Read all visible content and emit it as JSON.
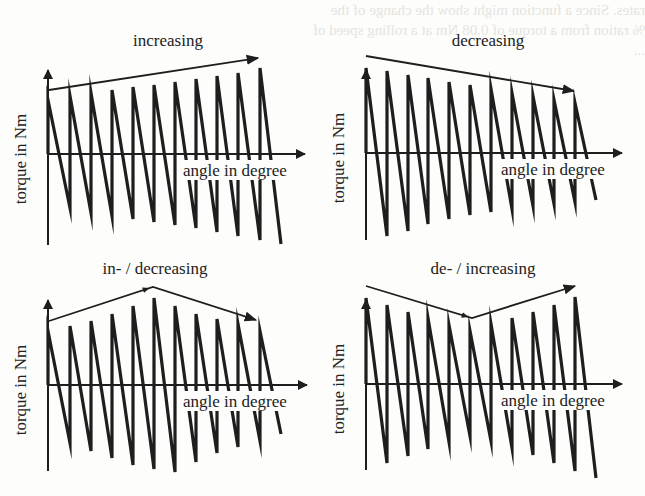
{
  "figure": {
    "colors": {
      "ink": "#1e1e1e",
      "background": "#fdfdfb",
      "bleed_through": "#e4e4e0"
    }
  },
  "chart_data": [
    {
      "id": "increasing",
      "type": "line",
      "title": "increasing",
      "xlabel": "angle in degree",
      "ylabel": "torque in Nm",
      "description": "sawtooth torque curve with amplitude increasing over angle",
      "origin": [
        48,
        154
      ],
      "y_axis": {
        "top": 68,
        "bottom": 245
      },
      "x_axis": {
        "end": 305
      },
      "peaks_x": [
        48,
        70,
        91,
        112,
        133,
        154,
        175,
        196,
        217,
        238,
        260
      ],
      "peaks_y": [
        100,
        96,
        93,
        90,
        87,
        85,
        82,
        79,
        76,
        73,
        68
      ],
      "troughs_x": [
        70,
        91,
        112,
        133,
        154,
        175,
        196,
        217,
        238,
        260,
        281
      ],
      "troughs_y": [
        208,
        213,
        216,
        219,
        222,
        225,
        228,
        232,
        236,
        240,
        244
      ],
      "trend": {
        "points": [
          [
            49,
            90
          ],
          [
            258,
            58
          ]
        ],
        "title_pos": [
          168,
          46
        ]
      }
    },
    {
      "id": "decreasing",
      "type": "line",
      "title": "decreasing",
      "xlabel": "angle in degree",
      "ylabel": "torque in Nm",
      "description": "sawtooth torque curve with amplitude decreasing over angle",
      "origin": [
        366,
        153
      ],
      "y_axis": {
        "top": 68,
        "bottom": 240
      },
      "x_axis": {
        "end": 622
      },
      "peaks_x": [
        366,
        387,
        408,
        428,
        449,
        470,
        491,
        512,
        533,
        554,
        575
      ],
      "peaks_y": [
        68,
        71,
        75,
        78,
        82,
        85,
        89,
        93,
        96,
        100,
        103
      ],
      "troughs_x": [
        387,
        408,
        428,
        449,
        470,
        491,
        512,
        533,
        554,
        575,
        596
      ],
      "troughs_y": [
        236,
        231,
        224,
        219,
        215,
        212,
        209,
        206,
        204,
        202,
        200
      ],
      "trend": {
        "points": [
          [
            366,
            56
          ],
          [
            574,
            91
          ]
        ],
        "title_pos": [
          488,
          46
        ]
      }
    },
    {
      "id": "in-decreasing",
      "type": "line",
      "title": "in- / decreasing",
      "xlabel": "angle in degree",
      "ylabel": "torque in Nm",
      "description": "sawtooth torque curve with amplitude first increasing then decreasing",
      "origin": [
        48,
        385
      ],
      "y_axis": {
        "top": 298,
        "bottom": 471
      },
      "x_axis": {
        "end": 307
      },
      "peaks_x": [
        48,
        70,
        91,
        112,
        133,
        154,
        175,
        196,
        217,
        238,
        260
      ],
      "peaks_y": [
        331,
        326,
        321,
        314,
        306,
        298,
        306,
        314,
        319,
        324,
        331
      ],
      "troughs_x": [
        70,
        91,
        112,
        133,
        154,
        175,
        196,
        217,
        238,
        260,
        281
      ],
      "troughs_y": [
        443,
        451,
        458,
        465,
        469,
        472,
        462,
        453,
        447,
        441,
        434
      ],
      "trend": {
        "points": [
          [
            49,
            321
          ],
          [
            153,
            287
          ],
          [
            256,
            320
          ]
        ],
        "title_pos": [
          155,
          274
        ]
      }
    },
    {
      "id": "de-increasing",
      "type": "line",
      "title": "de- / increasing",
      "xlabel": "angle in degree",
      "ylabel": "torque in Nm",
      "description": "sawtooth torque curve with amplitude first decreasing then increasing",
      "origin": [
        366,
        384
      ],
      "y_axis": {
        "top": 298,
        "bottom": 470
      },
      "x_axis": {
        "end": 622
      },
      "peaks_x": [
        366,
        387,
        408,
        428,
        449,
        470,
        491,
        512,
        533,
        554,
        575
      ],
      "peaks_y": [
        298,
        305,
        312,
        318,
        325,
        331,
        324,
        318,
        312,
        305,
        297
      ],
      "troughs_x": [
        387,
        408,
        428,
        449,
        470,
        491,
        512,
        533,
        554,
        575,
        596
      ],
      "troughs_y": [
        463,
        456,
        449,
        442,
        436,
        441,
        448,
        455,
        463,
        471,
        478
      ],
      "trend": {
        "points": [
          [
            366,
            286
          ],
          [
            472,
            318
          ],
          [
            575,
            286
          ]
        ],
        "title_pos": [
          483,
          274
        ]
      }
    }
  ],
  "bleed_through_text": [
    "rates. Since a function might show the change of the",
    "% ration from a torque of 0.08 Nm at a rolling speed of",
    "... "
  ]
}
